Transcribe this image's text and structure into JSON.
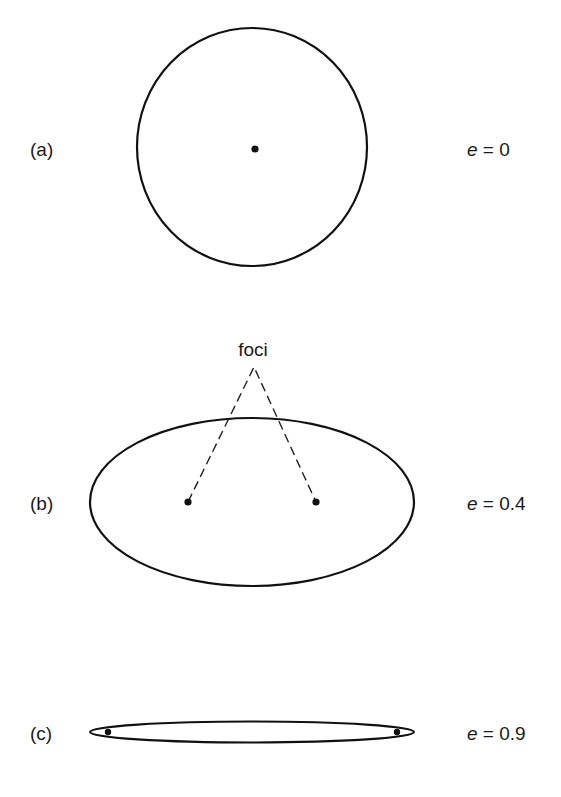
{
  "figure": {
    "title": "",
    "panels": [
      {
        "id": "a",
        "label": "(a)",
        "eccentricity_var": "e",
        "eccentricity_eq": " = ",
        "eccentricity_value": "0",
        "eccentricity": 0,
        "shape": "circle",
        "center": [
          252,
          147
        ],
        "rx": 115,
        "ry": 119,
        "points_marked": [
          "center"
        ]
      },
      {
        "id": "b",
        "label": "(b)",
        "eccentricity_var": "e",
        "eccentricity_eq": " = ",
        "eccentricity_value": "0.4",
        "eccentricity": 0.4,
        "shape": "ellipse",
        "center": [
          252,
          502
        ],
        "rx": 162,
        "ry": 84,
        "points_marked": [
          "focus-left",
          "focus-right"
        ]
      },
      {
        "id": "c",
        "label": "(c)",
        "eccentricity_var": "e",
        "eccentricity_eq": " = ",
        "eccentricity_value": "0.9",
        "eccentricity": 0.9,
        "shape": "ellipse",
        "center": [
          252,
          732
        ],
        "rx": 162,
        "ry": 10.5,
        "points_marked": [
          "focus-left",
          "focus-right"
        ]
      }
    ],
    "annotation": {
      "text": "foci",
      "target_panel": "b",
      "style": "dashed leader lines"
    },
    "colors": {
      "stroke": "#111111",
      "text": "#1a1a1a",
      "background": "#ffffff"
    }
  }
}
